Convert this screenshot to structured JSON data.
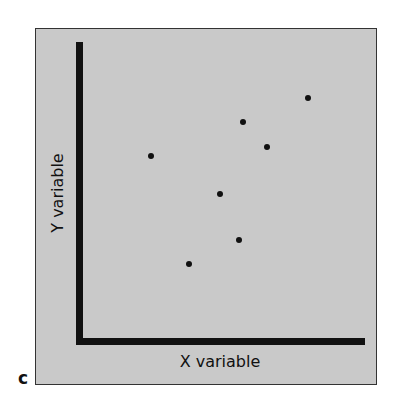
{
  "panel_label": "c",
  "chart_data": {
    "type": "scatter",
    "title": "",
    "xlabel": "X variable",
    "ylabel": "Y variable",
    "grid": false,
    "ticks": false,
    "xlim": [
      0,
      100
    ],
    "ylim": [
      0,
      100
    ],
    "points": [
      {
        "x": 23,
        "y": 63
      },
      {
        "x": 37,
        "y": 27
      },
      {
        "x": 48,
        "y": 50
      },
      {
        "x": 55,
        "y": 35
      },
      {
        "x": 57,
        "y": 74
      },
      {
        "x": 65,
        "y": 66
      },
      {
        "x": 80,
        "y": 82
      }
    ],
    "pixel_points": [
      {
        "px": 151,
        "py": 156
      },
      {
        "px": 189,
        "py": 264
      },
      {
        "px": 220,
        "py": 194
      },
      {
        "px": 239,
        "py": 240
      },
      {
        "px": 243,
        "py": 122
      },
      {
        "px": 267,
        "py": 147
      },
      {
        "px": 308,
        "py": 98
      }
    ],
    "colors": {
      "background": "#c9c9c9",
      "points": "#111111",
      "axes": "#111111"
    }
  }
}
